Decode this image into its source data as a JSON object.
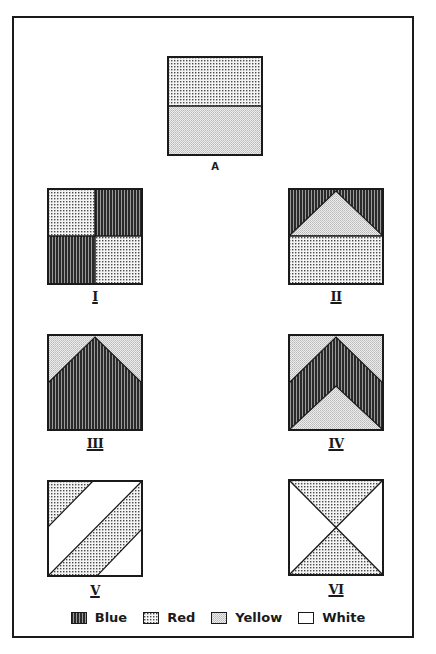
{
  "figures": {
    "A": {
      "label": "A",
      "description": "Square divided horizontally: top half red, bottom half yellow"
    },
    "I": {
      "label": "I",
      "description": "2x2 grid: top-left red, top-right blue, bottom-left blue, bottom-right red"
    },
    "II": {
      "label": "II",
      "description": "Top half blue with yellow triangle pointing up; bottom half red"
    },
    "III": {
      "label": "III",
      "description": "Yellow top corners, large blue pentagon (house shape) filling rest"
    },
    "IV": {
      "label": "IV",
      "description": "Yellow top corners, blue chevron band, yellow triangle at bottom"
    },
    "V": {
      "label": "V",
      "description": "White square with red diagonal bands: top-left corner triangle and central diagonal band"
    },
    "VI": {
      "label": "VI",
      "description": "White square with red hourglass: top and bottom triangles meeting in center; left and right triangles white"
    }
  },
  "legend": {
    "items": [
      {
        "name": "blue",
        "label": "Blue",
        "pattern": "vertical-stripes"
      },
      {
        "name": "red",
        "label": "Red",
        "pattern": "dots"
      },
      {
        "name": "yellow",
        "label": "Yellow",
        "pattern": "light-stipple"
      },
      {
        "name": "white",
        "label": "White",
        "pattern": "none"
      }
    ]
  },
  "colors": {
    "ink": "#1a1a1a",
    "blue_fill": "#3a3a3a",
    "red_fill": "#d8d8d8",
    "yellow_fill": "#e4e4e4",
    "white_fill": "#ffffff"
  }
}
